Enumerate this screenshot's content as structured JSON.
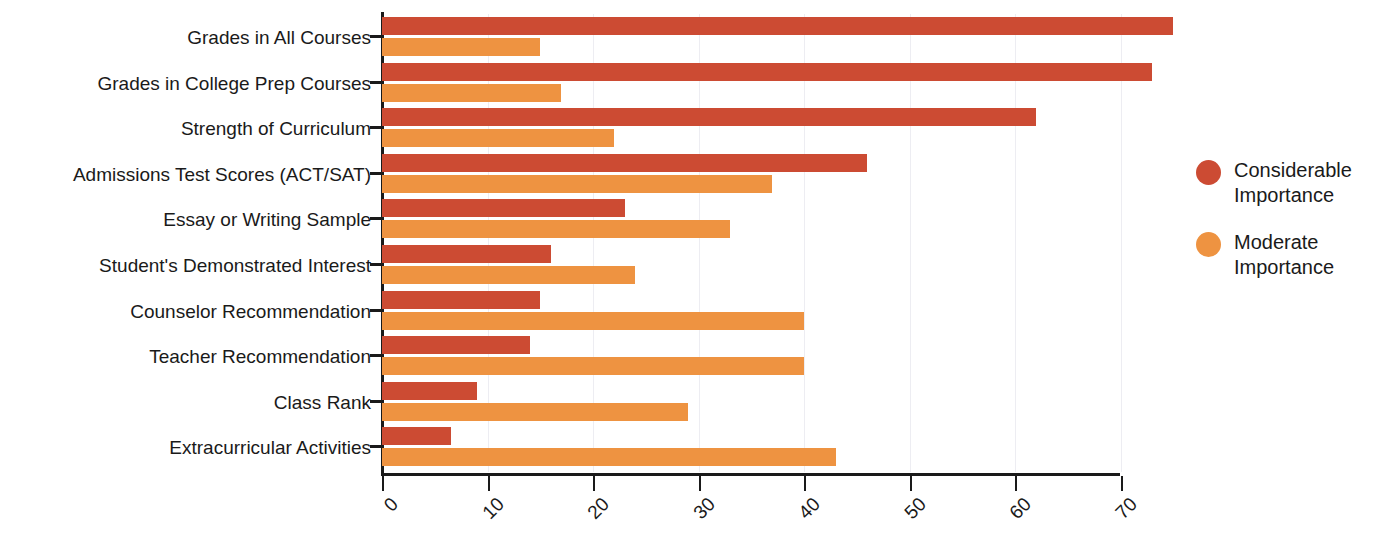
{
  "chart_data": {
    "type": "bar",
    "orientation": "horizontal",
    "title": "",
    "xlabel": "",
    "ylabel": "",
    "xlim": [
      0,
      75
    ],
    "xticks": [
      0,
      10,
      20,
      30,
      40,
      50,
      60,
      70
    ],
    "grid": true,
    "grid_axis": "x",
    "legend_position": "right",
    "categories": [
      "Grades in All Courses",
      "Grades in College Prep Courses",
      "Strength of Curriculum",
      "Admissions Test Scores (ACT/SAT)",
      "Essay or Writing Sample",
      "Student's Demonstrated Interest",
      "Counselor Recommendation",
      "Teacher Recommendation",
      "Class Rank",
      "Extracurricular Activities"
    ],
    "series": [
      {
        "name": "Considerable Importance",
        "color": "#CC4B33",
        "values": [
          75,
          73,
          62,
          46,
          23,
          16,
          15,
          14,
          9,
          6.5
        ]
      },
      {
        "name": "Moderate Importance",
        "color": "#EE9341",
        "values": [
          15,
          17,
          22,
          37,
          33,
          24,
          40,
          40,
          29,
          43
        ]
      }
    ]
  },
  "legend": {
    "items": [
      {
        "label_line1": "Considerable",
        "label_line2": "Importance",
        "color": "#CC4B33"
      },
      {
        "label_line1": "Moderate",
        "label_line2": "Importance",
        "color": "#EE9341"
      }
    ]
  }
}
